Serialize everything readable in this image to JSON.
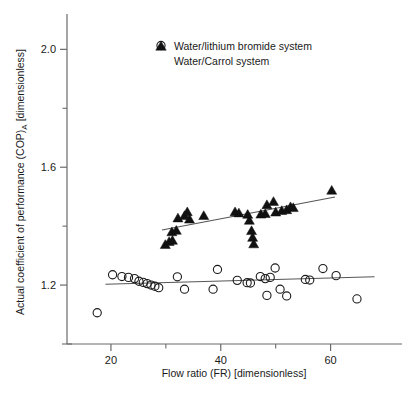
{
  "chart_data": {
    "type": "scatter",
    "title": "",
    "xlabel": "Flow ratio (FR) [dimensionless]",
    "ylabel": "Actual coefficient of performance (COP)A [dimensionless]",
    "ylabel_main": "Actual coefficient of performance (COP)",
    "ylabel_sub": "A",
    "ylabel_tail": " [dimensionless]",
    "xlim": [
      12.0,
      73.0
    ],
    "ylim": [
      1.0,
      2.12
    ],
    "grid": false,
    "legend_position": "top-center",
    "xticks": [
      20,
      40,
      60
    ],
    "xtick_labels": [
      "20",
      "40",
      "60"
    ],
    "xticks_minor": [
      30,
      50
    ],
    "yticks": [
      1.2,
      1.6,
      2.0
    ],
    "ytick_labels": [
      "1.2",
      "1.6",
      "2.0"
    ],
    "yticks_minor": [
      1.4,
      1.8
    ],
    "series": [
      {
        "name": "Water/lithium bromide system",
        "marker": "open-circle",
        "color": "#1a1a1a",
        "points": [
          [
            17.5,
            1.106
          ],
          [
            20.3,
            1.235
          ],
          [
            22.0,
            1.229
          ],
          [
            23.2,
            1.226
          ],
          [
            24.3,
            1.222
          ],
          [
            25.1,
            1.213
          ],
          [
            25.9,
            1.209
          ],
          [
            26.6,
            1.205
          ],
          [
            27.3,
            1.2
          ],
          [
            28.0,
            1.196
          ],
          [
            28.7,
            1.191
          ],
          [
            32.1,
            1.228
          ],
          [
            33.4,
            1.186
          ],
          [
            38.6,
            1.186
          ],
          [
            39.4,
            1.253
          ],
          [
            43.0,
            1.216
          ],
          [
            44.8,
            1.208
          ],
          [
            45.4,
            1.207
          ],
          [
            47.2,
            1.229
          ],
          [
            48.1,
            1.222
          ],
          [
            48.4,
            1.165
          ],
          [
            49.0,
            1.226
          ],
          [
            49.9,
            1.258
          ],
          [
            50.8,
            1.186
          ],
          [
            52.0,
            1.163
          ],
          [
            55.4,
            1.219
          ],
          [
            56.2,
            1.217
          ],
          [
            58.6,
            1.256
          ],
          [
            61.0,
            1.232
          ],
          [
            64.8,
            1.153
          ]
        ],
        "fit_line": {
          "x": [
            19.0,
            68.0
          ],
          "y": [
            1.203,
            1.228
          ]
        }
      },
      {
        "name": "Water/Carrol system",
        "marker": "filled-triangle",
        "color": "#111111",
        "points": [
          [
            29.9,
            1.338
          ],
          [
            30.6,
            1.348
          ],
          [
            31.2,
            1.352
          ],
          [
            31.1,
            1.381
          ],
          [
            31.9,
            1.386
          ],
          [
            32.2,
            1.428
          ],
          [
            33.4,
            1.436
          ],
          [
            33.9,
            1.449
          ],
          [
            34.3,
            1.424
          ],
          [
            36.9,
            1.436
          ],
          [
            42.6,
            1.449
          ],
          [
            43.3,
            1.445
          ],
          [
            44.9,
            1.44
          ],
          [
            45.2,
            1.42
          ],
          [
            45.6,
            1.385
          ],
          [
            45.8,
            1.362
          ],
          [
            46.0,
            1.34
          ],
          [
            47.3,
            1.441
          ],
          [
            48.1,
            1.443
          ],
          [
            48.4,
            1.473
          ],
          [
            49.6,
            1.484
          ],
          [
            50.0,
            1.448
          ],
          [
            51.1,
            1.453
          ],
          [
            52.0,
            1.456
          ],
          [
            52.7,
            1.466
          ],
          [
            53.2,
            1.463
          ],
          [
            60.2,
            1.522
          ]
        ],
        "fit_line": {
          "x": [
            29.3,
            60.8
          ],
          "y": [
            1.387,
            1.499
          ]
        }
      }
    ]
  },
  "legend": {
    "entries": [
      {
        "label": "Water/lithium bromide system",
        "marker": "open-circle"
      },
      {
        "label": "Water/Carrol system",
        "marker": "filled-triangle"
      }
    ]
  }
}
